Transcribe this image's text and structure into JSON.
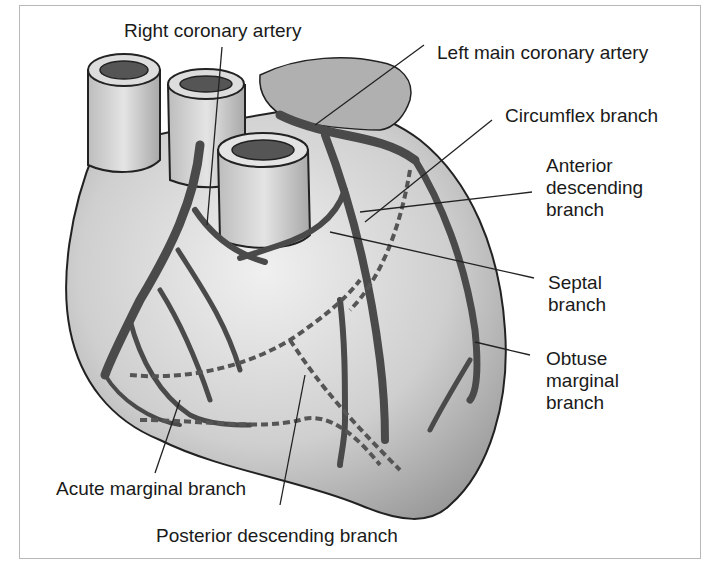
{
  "diagram": {
    "labels": {
      "right_coronary_artery": "Right coronary artery",
      "left_main_coronary_artery": "Left main coronary artery",
      "circumflex_branch": "Circumflex branch",
      "anterior_descending_branch": [
        "Anterior",
        "descending",
        "branch"
      ],
      "septal_branch": [
        "Septal",
        "branch"
      ],
      "obtuse_marginal_branch": [
        "Obtuse",
        "marginal",
        "branch"
      ],
      "acute_marginal_branch": "Acute marginal branch",
      "posterior_descending_branch": "Posterior descending branch"
    },
    "colors": {
      "frame": "#b8b8b8",
      "heart_fill": "#c8c8c8",
      "heart_light": "#e6e6e6",
      "artery": "#555555",
      "outline": "#222222",
      "text": "#1a1a1a"
    }
  }
}
